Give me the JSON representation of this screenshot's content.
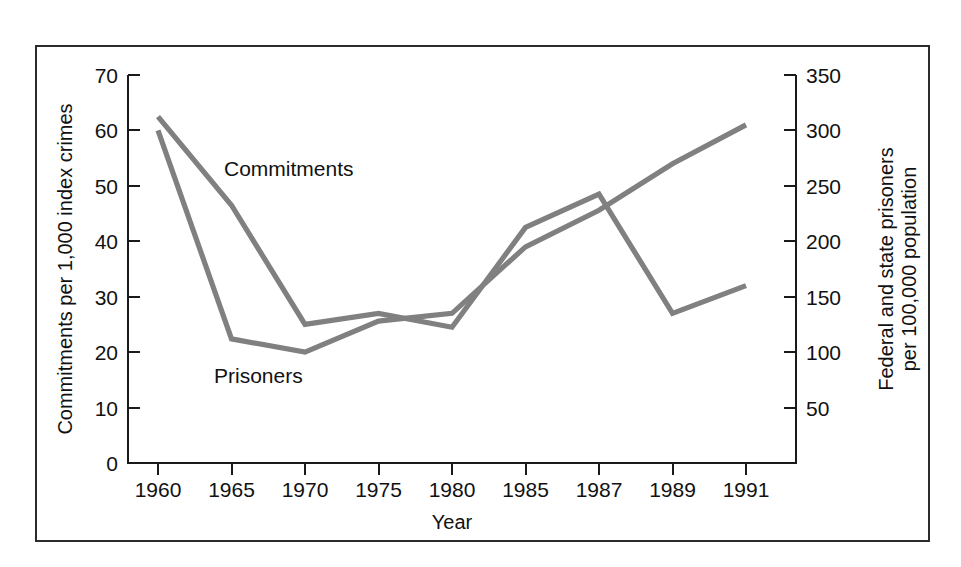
{
  "chart_data": {
    "type": "line",
    "title": "",
    "subtitle": "",
    "xlabel": "Year",
    "ylabel": "Commitments per 1,000 index crimes",
    "ylabel_right": "Federal and state prisoners per 100,000 population",
    "categories": [
      "1960",
      "1965",
      "1970",
      "1975",
      "1980",
      "1985",
      "1987",
      "1989",
      "1991"
    ],
    "ylim": [
      0,
      70
    ],
    "yticks": [
      0,
      10,
      20,
      30,
      40,
      50,
      60,
      70
    ],
    "ylim_right": [
      0,
      350
    ],
    "yticks_right": [
      50,
      100,
      150,
      200,
      250,
      300,
      350
    ],
    "grid": false,
    "legend": "inline-annotations",
    "series": [
      {
        "name": "Commitments",
        "axis": "left",
        "color": "#808080",
        "values": [
          62.5,
          46.5,
          25.0,
          27.0,
          24.5,
          42.5,
          48.5,
          27.0,
          32.0
        ]
      },
      {
        "name": "Prisoners",
        "axis": "right",
        "color": "#808080",
        "values": [
          300,
          112,
          100,
          128,
          135,
          195,
          228,
          270,
          305
        ]
      }
    ],
    "annotations": [
      {
        "text": "Commitments",
        "x_px": 224,
        "y_px": 176
      },
      {
        "text": "Prisoners",
        "x_px": 214,
        "y_px": 383
      }
    ],
    "colors": {
      "line": "#808080",
      "axis": "#1a1a1a",
      "frame": "#2b2b2b",
      "background": "#ffffff",
      "text": "#111111"
    }
  },
  "axes": {
    "left_tick_labels": [
      "70",
      "60",
      "50",
      "40",
      "30",
      "20",
      "10",
      "0"
    ],
    "right_tick_labels": [
      "350",
      "300",
      "250",
      "200",
      "150",
      "100",
      "50"
    ],
    "x_tick_labels": [
      "1960",
      "1965",
      "1970",
      "1975",
      "1980",
      "1985",
      "1987",
      "1989",
      "1991"
    ],
    "x_title": "Year",
    "y_title_left": "Commitments per 1,000 index crimes",
    "y_title_right_line1": "Federal and state prisoners",
    "y_title_right_line2": "per 100,000 population"
  },
  "annotations": {
    "commitments_label": "Commitments",
    "prisoners_label": "Prisoners"
  }
}
